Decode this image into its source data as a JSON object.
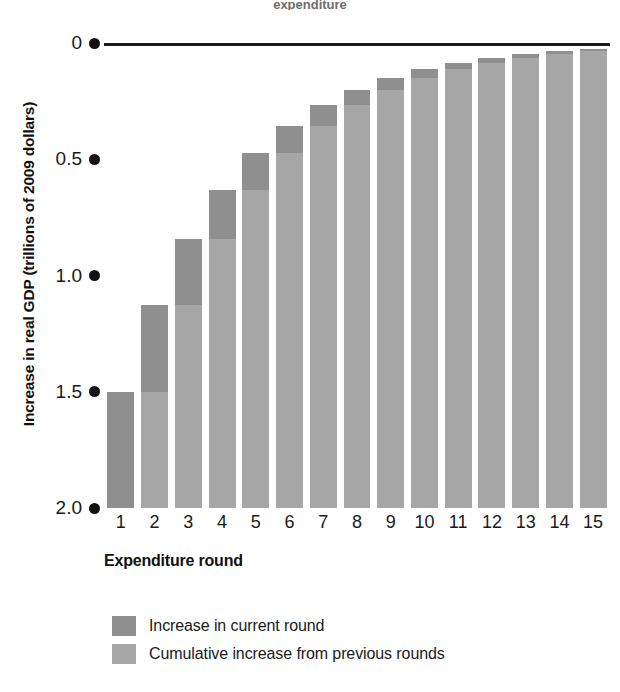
{
  "figure": {
    "title_remnant": "expenditure"
  },
  "axes": {
    "ylabel": "Increase in real GDP (trillions of 2009 dollars)",
    "xlabel": "Expenditure round",
    "yticks": [
      "2.0",
      "1.5",
      "1.0",
      "0.5",
      "0"
    ],
    "ytick_values": [
      2.0,
      1.5,
      1.0,
      0.5,
      0
    ]
  },
  "legend": {
    "items": [
      {
        "label": "Increase in current round",
        "color": "#8f8f8f"
      },
      {
        "label": "Cumulative increase from previous rounds",
        "color": "#a6a6a6"
      }
    ]
  },
  "colors": {
    "current_round": "#8f8f8f",
    "cumulative": "#a6a6a6",
    "axis": "#111111",
    "background": "#ffffff"
  },
  "chart_data": {
    "type": "bar",
    "title": "",
    "xlabel": "Expenditure round",
    "ylabel": "Increase in real GDP (trillions of 2009 dollars)",
    "ylim": [
      0,
      2.0
    ],
    "yticks": [
      0,
      0.5,
      1.0,
      1.5,
      2.0
    ],
    "grid": false,
    "legend_position": "bottom-left",
    "stacked": true,
    "reference_line": {
      "value": 2.0,
      "label": ""
    },
    "categories": [
      "1",
      "2",
      "3",
      "4",
      "5",
      "6",
      "7",
      "8",
      "9",
      "10",
      "11",
      "12",
      "13",
      "14",
      "15"
    ],
    "series": [
      {
        "name": "Cumulative increase from previous rounds",
        "color": "#a6a6a6",
        "values": [
          0,
          0.5,
          0.875,
          1.156,
          1.367,
          1.525,
          1.644,
          1.733,
          1.8,
          1.85,
          1.887,
          1.915,
          1.937,
          1.952,
          1.964
        ]
      },
      {
        "name": "Increase in current round",
        "color": "#8f8f8f",
        "values": [
          0.5,
          0.375,
          0.281,
          0.211,
          0.158,
          0.119,
          0.089,
          0.067,
          0.05,
          0.037,
          0.028,
          0.022,
          0.015,
          0.012,
          0.009
        ]
      }
    ],
    "totals": [
      0.5,
      0.875,
      1.156,
      1.367,
      1.525,
      1.644,
      1.733,
      1.8,
      1.85,
      1.887,
      1.915,
      1.937,
      1.952,
      1.964,
      1.973
    ]
  }
}
